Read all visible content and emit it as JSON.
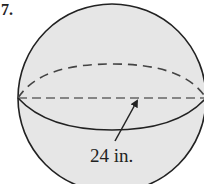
{
  "figure": {
    "type": "sphere",
    "problem_marker": "7.",
    "dimension_label": "24 in.",
    "dimension_type": "diameter",
    "colors": {
      "fill": "#e6e6e6",
      "stroke": "#222222",
      "dashed": "#555555"
    }
  }
}
